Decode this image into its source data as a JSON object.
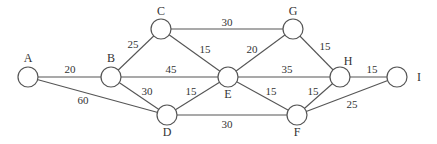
{
  "diagram": {
    "type": "weighted-undirected-graph",
    "nodes": [
      {
        "id": "A",
        "label": "A",
        "x": 28,
        "y": 77,
        "lx": 28,
        "ly": 62
      },
      {
        "id": "B",
        "label": "B",
        "x": 111,
        "y": 77,
        "lx": 111,
        "ly": 62
      },
      {
        "id": "C",
        "label": "C",
        "x": 161,
        "y": 29,
        "lx": 161,
        "ly": 15
      },
      {
        "id": "D",
        "label": "D",
        "x": 167,
        "y": 115,
        "lx": 167,
        "ly": 136
      },
      {
        "id": "E",
        "label": "E",
        "x": 228,
        "y": 77,
        "lx": 228,
        "ly": 98
      },
      {
        "id": "G",
        "label": "G",
        "x": 293,
        "y": 29,
        "lx": 293,
        "ly": 15
      },
      {
        "id": "H",
        "label": "H",
        "x": 340,
        "y": 77,
        "lx": 348,
        "ly": 65
      },
      {
        "id": "F",
        "label": "F",
        "x": 297,
        "y": 115,
        "lx": 297,
        "ly": 136
      },
      {
        "id": "I",
        "label": "I",
        "x": 397,
        "y": 77,
        "lx": 419,
        "ly": 81
      }
    ],
    "edges": [
      {
        "from": "A",
        "to": "B",
        "weight": "20",
        "wx": 70,
        "wy": 73
      },
      {
        "from": "A",
        "to": "D",
        "weight": "60",
        "wx": 83,
        "wy": 104
      },
      {
        "from": "B",
        "to": "C",
        "weight": "25",
        "wx": 133,
        "wy": 48
      },
      {
        "from": "B",
        "to": "E",
        "weight": "45",
        "wx": 171,
        "wy": 73
      },
      {
        "from": "B",
        "to": "D",
        "weight": "30",
        "wx": 147,
        "wy": 95
      },
      {
        "from": "C",
        "to": "G",
        "weight": "30",
        "wx": 227,
        "wy": 26
      },
      {
        "from": "C",
        "to": "E",
        "weight": "15",
        "wx": 205,
        "wy": 53
      },
      {
        "from": "D",
        "to": "E",
        "weight": "15",
        "wx": 191,
        "wy": 95
      },
      {
        "from": "D",
        "to": "F",
        "weight": "30",
        "wx": 227,
        "wy": 128
      },
      {
        "from": "E",
        "to": "G",
        "weight": "20",
        "wx": 252,
        "wy": 53
      },
      {
        "from": "E",
        "to": "H",
        "weight": "35",
        "wx": 287,
        "wy": 73
      },
      {
        "from": "E",
        "to": "F",
        "weight": "15",
        "wx": 271,
        "wy": 95
      },
      {
        "from": "G",
        "to": "H",
        "weight": "15",
        "wx": 325,
        "wy": 50
      },
      {
        "from": "H",
        "to": "I",
        "weight": "15",
        "wx": 372,
        "wy": 73
      },
      {
        "from": "F",
        "to": "H",
        "weight": "15",
        "wx": 313,
        "wy": 95
      },
      {
        "from": "F",
        "to": "I",
        "weight": "25",
        "wx": 352,
        "wy": 108
      }
    ],
    "colors": {
      "stroke": "#555555",
      "text": "#333333",
      "background": "#ffffff"
    }
  }
}
